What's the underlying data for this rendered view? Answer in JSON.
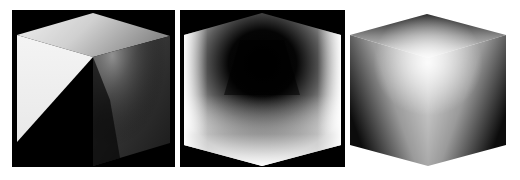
{
  "figure": {
    "background": "#ffffff",
    "panels": [
      {
        "id": "cube-shaded-diagonal",
        "background": "#000000",
        "box": {
          "x": 12,
          "y": 10,
          "w": 163,
          "h": 157
        },
        "vertices": {
          "top": [
            93,
            13
          ],
          "top_left": [
            17,
            35
          ],
          "top_right": [
            170,
            36
          ],
          "center": [
            93,
            57
          ],
          "bottom_left": [
            17,
            142
          ],
          "bottom_right": [
            170,
            143
          ],
          "bottom": [
            93,
            166
          ]
        },
        "faces": {
          "top_color_light": "#f2f2f2",
          "top_color_dark": "#9a9a9a",
          "left_color": "#f4f4f4",
          "shadow_color": "#000000",
          "right_color_light": "#8c8c8c",
          "right_color_dark": "#1e1e1e"
        }
      },
      {
        "id": "cube-inverted-depth",
        "background": "#000000",
        "box": {
          "x": 180,
          "y": 10,
          "w": 165,
          "h": 157
        },
        "vertices": {
          "top": [
            262,
            13
          ],
          "top_left": [
            184,
            35
          ],
          "top_right": [
            341,
            35
          ],
          "bottom_left": [
            184,
            145
          ],
          "bottom_right": [
            341,
            145
          ],
          "bottom": [
            262,
            166
          ]
        },
        "faces": {
          "edge_color": "#ffffff",
          "center_color": "#000000",
          "mid_color": "#6e6e6e"
        }
      },
      {
        "id": "cube-glossy",
        "background": "#ffffff",
        "box": {
          "x": 348,
          "y": 10,
          "w": 162,
          "h": 160
        },
        "vertices": {
          "top": [
            427,
            14
          ],
          "top_left": [
            350,
            35
          ],
          "top_right": [
            506,
            35
          ],
          "center": [
            428,
            58
          ],
          "bottom_left": [
            350,
            145
          ],
          "bottom_right": [
            506,
            145
          ],
          "bottom": [
            428,
            166
          ]
        },
        "faces": {
          "highlight_color": "#f2f2f2",
          "mid_color": "#a8a8a8",
          "dark_color": "#0a0a0a"
        }
      }
    ]
  }
}
